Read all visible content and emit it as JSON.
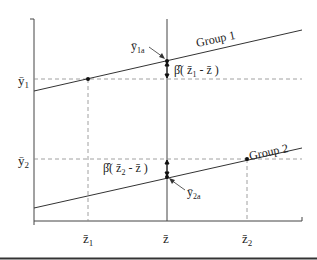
{
  "diagram": {
    "y_labels": {
      "y1": "ȳ",
      "y1_sub": "1",
      "y2": "ȳ",
      "y2_sub": "2"
    },
    "x_labels": {
      "z1": "z̄",
      "z1_sub": "1",
      "z": "z̄",
      "z2": "z̄",
      "z2_sub": "2"
    },
    "group1": {
      "label": "Group 1"
    },
    "group2": {
      "label": "Group 2"
    },
    "annot_top": {
      "y": "ȳ",
      "sub": "1a",
      "beta": "β̂( z̄",
      "beta_sub": "1",
      "beta_rest": " - z̄ )"
    },
    "annot_bot": {
      "y": "ȳ",
      "sub": "2a",
      "beta": "β̂( z̄",
      "beta_sub": "2",
      "beta_rest": " - z̄ )"
    }
  }
}
